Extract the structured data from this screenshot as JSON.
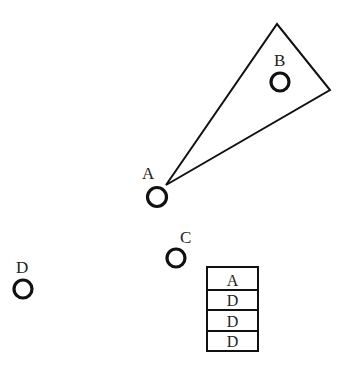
{
  "diagram": {
    "nodes": [
      {
        "id": "A",
        "label": "A",
        "cx": 157,
        "cy": 197,
        "r": 9.5
      },
      {
        "id": "B",
        "label": "B",
        "cx": 280,
        "cy": 82,
        "r": 9
      },
      {
        "id": "C",
        "label": "C",
        "cx": 176,
        "cy": 258,
        "r": 9
      },
      {
        "id": "D",
        "label": "D",
        "cx": 23,
        "cy": 289,
        "r": 9
      }
    ],
    "cone": {
      "from": "A",
      "points": [
        [
          166,
          185
        ],
        [
          277,
          24
        ],
        [
          330,
          90
        ]
      ]
    },
    "table": {
      "rows": [
        "A",
        "D",
        "D",
        "D"
      ]
    }
  }
}
